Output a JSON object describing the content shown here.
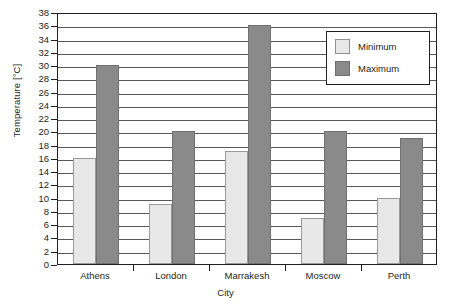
{
  "chart_data": {
    "type": "bar",
    "title": "",
    "xlabel": "City",
    "ylabel": "Temperature [°C]",
    "categories": [
      "Athens",
      "London",
      "Marrakesh",
      "Moscow",
      "Perth"
    ],
    "series": [
      {
        "name": "Minimum",
        "values": [
          16,
          9,
          17,
          7,
          10
        ],
        "color": "#e8e8e8"
      },
      {
        "name": "Maximum",
        "values": [
          30,
          20,
          36,
          20,
          19
        ],
        "color": "#8a8a8a"
      }
    ],
    "ylim": [
      0,
      38
    ],
    "ytick_step": 2,
    "yticks": [
      0,
      2,
      4,
      6,
      8,
      10,
      12,
      14,
      16,
      18,
      20,
      22,
      24,
      26,
      28,
      30,
      32,
      34,
      36,
      38
    ],
    "grid": true,
    "legend_position": "top-right"
  },
  "legend": {
    "entries": [
      {
        "label": "Minimum"
      },
      {
        "label": "Maximum"
      }
    ]
  },
  "colors": {
    "minimum": "#e8e8e8",
    "maximum": "#8a8a8a",
    "axis": "#231f20",
    "grid": "#595959",
    "background": "#ffffff"
  }
}
